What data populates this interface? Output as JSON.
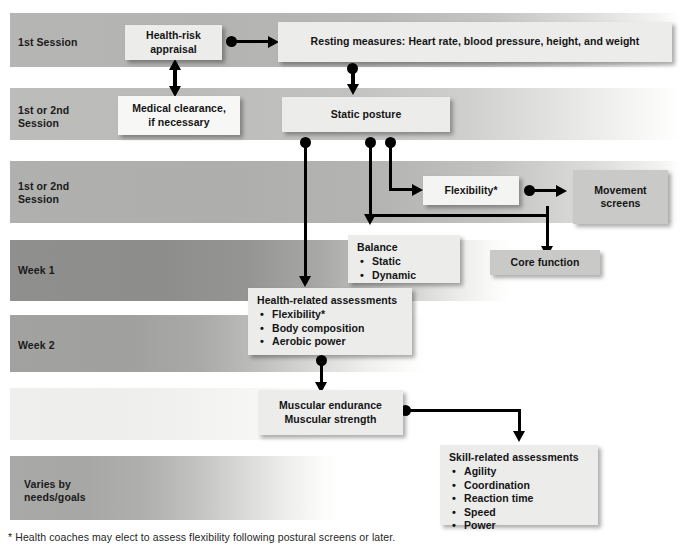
{
  "figure": {
    "kind": "flowchart",
    "footnote": "* Health coaches may elect to assess flexibility following postural screens or later."
  },
  "palette": {
    "box_light": "#ececeb",
    "box_dark": "#c9c9c7",
    "band_mid": "#b4b4b2",
    "band_dark": "#8b8b89",
    "band_pale": "#e9e9e8",
    "line": "#000000",
    "text": "#141414"
  },
  "timeline": {
    "rows": [
      {
        "id": "row-1st-session",
        "label": "1st Session",
        "shade": "mid"
      },
      {
        "id": "row-1st-or-2nd-a",
        "label": "1st or 2nd\nSession",
        "shade": "mid-light"
      },
      {
        "id": "row-1st-or-2nd-b",
        "label": "1st or 2nd\nSession",
        "shade": "mid"
      },
      {
        "id": "row-week-1",
        "label": "Week 1",
        "shade": "dark"
      },
      {
        "id": "row-week-2",
        "label": "Week 2",
        "shade": "mid"
      },
      {
        "id": "row-blank",
        "label": "",
        "shade": "pale"
      },
      {
        "id": "row-varies",
        "label": "Varies by\nneeds/goals",
        "shade": "mid"
      }
    ],
    "labels": {
      "r1": "1st Session",
      "r2_line1": "1st or 2nd",
      "r2_line2": "Session",
      "r3_line1": "1st or 2nd",
      "r3_line2": "Session",
      "r4": "Week 1",
      "r5": "Week 2",
      "r7_line1": "Varies by",
      "r7_line2": "needs/goals"
    }
  },
  "nodes": {
    "health_risk_appraisal": {
      "line1": "Health-risk",
      "line2": "appraisal"
    },
    "resting_measures": {
      "text": "Resting measures: Heart rate, blood pressure, height, and weight"
    },
    "medical_clearance": {
      "line1": "Medical clearance,",
      "line2": "if necessary"
    },
    "static_posture": {
      "text": "Static posture"
    },
    "flexibility": {
      "text": "Flexibility*"
    },
    "movement_screens": {
      "line1": "Movement",
      "line2": "screens"
    },
    "balance": {
      "title": "Balance",
      "items": [
        "Static",
        "Dynamic"
      ]
    },
    "core_function": {
      "text": "Core function"
    },
    "health_related_assessments": {
      "title": "Health-related assessments",
      "items": [
        "Flexibility*",
        "Body composition",
        "Aerobic power"
      ]
    },
    "muscular": {
      "line1": "Muscular endurance",
      "line2": "Muscular strength"
    },
    "skill_related_assessments": {
      "title": "Skill-related assessments",
      "items": [
        "Agility",
        "Coordination",
        "Reaction time",
        "Speed",
        "Power"
      ]
    }
  }
}
